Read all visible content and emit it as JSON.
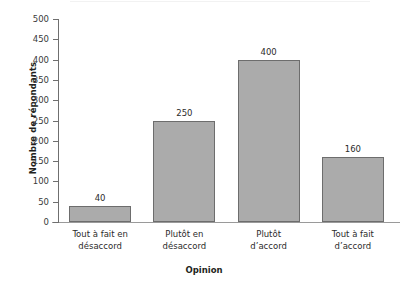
{
  "chart_data": {
    "type": "bar",
    "title": "",
    "subtitle": "",
    "xlabel": "Opinion",
    "ylabel": "Nombre de répondants",
    "categories": [
      "Tout à fait en désaccord",
      "Plutôt en désaccord",
      "Plutôt d’accord",
      "Tout à fait d’accord"
    ],
    "category_lines": [
      [
        "Tout à fait en",
        "désaccord"
      ],
      [
        "Plutôt en",
        "désaccord"
      ],
      [
        "Plutôt",
        "d’accord"
      ],
      [
        "Tout à fait",
        "d’accord"
      ]
    ],
    "values": [
      40,
      250,
      400,
      160
    ],
    "value_labels": [
      "40",
      "250",
      "400",
      "160"
    ],
    "ylim": [
      0,
      500
    ],
    "ytick_step": 50,
    "yticks": [
      0,
      50,
      100,
      150,
      200,
      250,
      300,
      350,
      400,
      450,
      500
    ],
    "ytick_labels": [
      "0",
      "50",
      "100",
      "150",
      "200",
      "250",
      "300",
      "350",
      "400",
      "450",
      "500"
    ],
    "grid": false,
    "legend": null,
    "legend_position": "none",
    "bar_fill_color": "#ababab",
    "bar_edge_color": "#6d6d6d",
    "axis_color": "#6f6f6f",
    "text_color": "#231f20"
  }
}
